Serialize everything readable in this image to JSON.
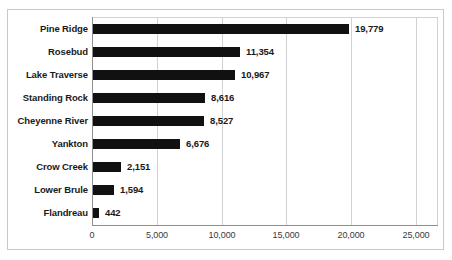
{
  "chart_data": {
    "type": "bar",
    "orientation": "horizontal",
    "title": "",
    "subtitle": "",
    "xlabel": "",
    "ylabel": "",
    "categories": [
      "Pine Ridge",
      "Rosebud",
      "Lake Traverse",
      "Standing Rock",
      "Cheyenne River",
      "Yankton",
      "Crow Creek",
      "Lower Brule",
      "Flandreau"
    ],
    "values": [
      19779,
      11354,
      10967,
      8616,
      8527,
      6676,
      2151,
      1594,
      442
    ],
    "value_labels": [
      "19,779",
      "11,354",
      "10,967",
      "8,616",
      "8,527",
      "6,676",
      "2,151",
      "1,594",
      "442"
    ],
    "xlim": [
      0,
      25000
    ],
    "xticks": [
      0,
      5000,
      10000,
      15000,
      20000,
      25000
    ],
    "xtick_labels": [
      "0",
      "5,000",
      "10,000",
      "15,000",
      "20,000",
      "25,000"
    ],
    "grid": true,
    "grid_axis": "x",
    "legend": false,
    "legend_position": "none",
    "bar_color": "#111111",
    "grid_color": "#d2d2d2",
    "axis_color": "#8f8f8f",
    "background_color": "#ffffff",
    "frame_color": "#c9c9c9"
  }
}
